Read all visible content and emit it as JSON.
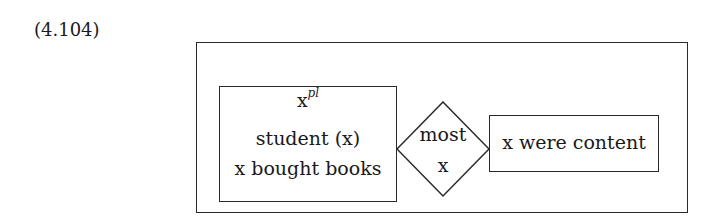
{
  "example_number": "(4.104)",
  "drs": {
    "restrictor": {
      "referent": "x",
      "referent_superscript": "pl",
      "conditions": [
        "student (x)",
        "x bought books"
      ]
    },
    "duplex_condition": {
      "quantifier": "most",
      "variable": "x"
    },
    "scope": {
      "conditions": [
        "x were content"
      ]
    }
  },
  "colors": {
    "line": "#2a2a2a",
    "text": "#1a1a1a",
    "background": "#ffffff"
  }
}
